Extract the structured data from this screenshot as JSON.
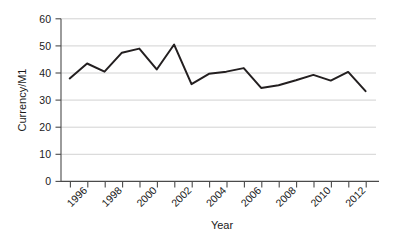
{
  "chart_data": {
    "type": "line",
    "title": "",
    "xlabel": "Year",
    "ylabel": "Currency/M1",
    "x": [
      1995,
      1996,
      1997,
      1998,
      1999,
      2000,
      2001,
      2002,
      2003,
      2004,
      2005,
      2006,
      2007,
      2008,
      2009,
      2010,
      2011,
      2012
    ],
    "series": [
      {
        "name": "Currency/M1",
        "values": [
          38.0,
          43.5,
          40.5,
          47.5,
          49.0,
          41.3,
          50.5,
          35.9,
          39.7,
          40.5,
          41.8,
          34.5,
          35.5,
          37.3,
          39.3,
          37.2,
          40.4,
          33.3
        ]
      }
    ],
    "xlim": [
      1994.5,
      2012.6
    ],
    "ylim": [
      0,
      60
    ],
    "yticks": [
      0,
      10,
      20,
      30,
      40,
      50,
      60
    ],
    "ytick_labels": [
      "0",
      "10",
      "20",
      "30",
      "40",
      "50",
      "60"
    ],
    "xticks": [
      1995,
      1996,
      1997,
      1998,
      1999,
      2000,
      2001,
      2002,
      2003,
      2004,
      2005,
      2006,
      2007,
      2008,
      2009,
      2010,
      2011,
      2012
    ],
    "xtick_labels_shown": [
      "1996",
      "1998",
      "2000",
      "2002",
      "2004",
      "2006",
      "2008",
      "2010",
      "2012"
    ],
    "xtick_label_rotation": -45,
    "grid": "horizontal",
    "legend": "none",
    "line_color": "#231f20",
    "grid_color": "#cdcdcd",
    "axis_color": "#4a4a4a",
    "background_color": "#ffffff"
  },
  "axis": {
    "y_labels": {
      "t0": "0",
      "t10": "10",
      "t20": "20",
      "t30": "30",
      "t40": "40",
      "t50": "50",
      "t60": "60"
    },
    "x_labels": {
      "l1996": "1996",
      "l1998": "1998",
      "l2000": "2000",
      "l2002": "2002",
      "l2004": "2004",
      "l2006": "2006",
      "l2008": "2008",
      "l2010": "2010",
      "l2012": "2012"
    },
    "x_title": "Year",
    "y_title": "Currency/M1"
  }
}
